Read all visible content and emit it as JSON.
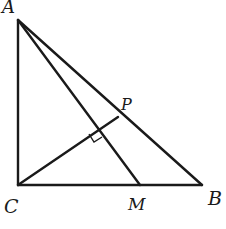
{
  "diagram": {
    "type": "geometry",
    "stroke_color": "#1a1a1a",
    "points": {
      "A": {
        "label": "A",
        "x": 18,
        "y": 20
      },
      "C": {
        "label": "C",
        "x": 18,
        "y": 185
      },
      "B": {
        "label": "B",
        "x": 202,
        "y": 185
      },
      "M": {
        "label": "M",
        "x": 140,
        "y": 185
      },
      "P": {
        "label": "P",
        "x": 118,
        "y": 117
      }
    },
    "segments": [
      "AC",
      "CB",
      "AB",
      "AM",
      "CP"
    ],
    "right_angle_marks": [
      "intersection of CP and AM"
    ]
  }
}
